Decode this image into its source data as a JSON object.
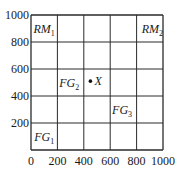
{
  "chart_data": {
    "type": "scatter",
    "title": "",
    "xlabel": "",
    "ylabel": "",
    "xlim": [
      0,
      1000
    ],
    "ylim": [
      0,
      1000
    ],
    "grid": true,
    "grid_step": 200,
    "x_ticks": [
      "0",
      "200",
      "400",
      "600",
      "800",
      "1000"
    ],
    "y_ticks": [
      "200",
      "400",
      "600",
      "800",
      "1000"
    ],
    "regions": [
      {
        "name": "RM",
        "sub": "1",
        "x": 100,
        "y": 900
      },
      {
        "name": "RM",
        "sub": "2",
        "x": 920,
        "y": 900
      },
      {
        "name": "FG",
        "sub": "2",
        "x": 290,
        "y": 500
      },
      {
        "name": "FG",
        "sub": "3",
        "x": 690,
        "y": 300
      },
      {
        "name": "FG",
        "sub": "1",
        "x": 100,
        "y": 100
      }
    ],
    "points": [
      {
        "label": "X",
        "x": 450,
        "y": 510
      }
    ]
  }
}
